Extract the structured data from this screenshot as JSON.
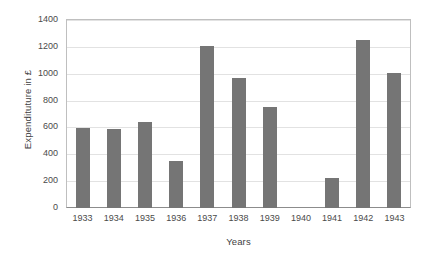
{
  "chart_data": {
    "type": "bar",
    "title": "",
    "xlabel": "Years",
    "ylabel": "Expendituture in £",
    "categories": [
      "1933",
      "1934",
      "1935",
      "1936",
      "1937",
      "1938",
      "1939",
      "1940",
      "1941",
      "1942",
      "1943"
    ],
    "values": [
      595,
      590,
      640,
      350,
      1205,
      970,
      750,
      0,
      220,
      1250,
      1005
    ],
    "ylim": [
      0,
      1400
    ],
    "ytick_labels": [
      "1400",
      "1200",
      "1000",
      "800",
      "600",
      "400",
      "200",
      "0"
    ],
    "ytick_values": [
      1400,
      1200,
      1000,
      800,
      600,
      400,
      200,
      0
    ],
    "grid": true,
    "legend": false,
    "series": [
      {
        "name": "Expenditure",
        "values": [
          595,
          590,
          640,
          350,
          1205,
          970,
          750,
          0,
          220,
          1250,
          1005
        ]
      }
    ],
    "colors": {
      "bar": "#757575",
      "gridline": "#e2e2e2",
      "axis": "#8c8c8c",
      "frame": "#bfbfbf",
      "text": "#4a4a4a",
      "background": "#ffffff"
    }
  }
}
